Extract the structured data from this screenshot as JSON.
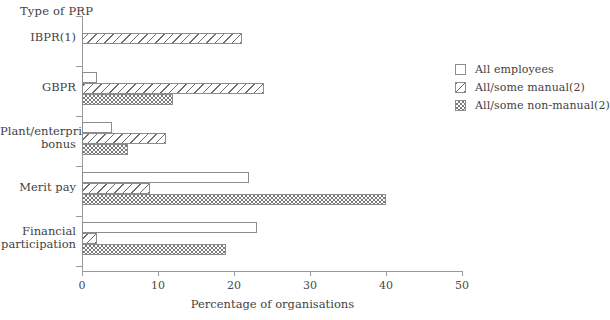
{
  "chart_data": {
    "type": "bar",
    "orientation": "horizontal",
    "title": "",
    "ylabel": "Type of PRP",
    "xlabel": "Percentage of organisations",
    "xlim": [
      0,
      50
    ],
    "xticks": [
      0,
      10,
      20,
      30,
      40,
      50
    ],
    "grid": false,
    "legend_position": "right",
    "categories": [
      "IBPR(1)",
      "GBPR",
      "Plant/enterprise\nbonus",
      "Merit pay",
      "Financial\nparticipation"
    ],
    "series": [
      {
        "name": "All employees",
        "fill": "plain",
        "values": [
          0,
          2,
          4,
          22,
          23
        ]
      },
      {
        "name": "All/some manual(2)",
        "fill": "hatch",
        "values": [
          21,
          24,
          11,
          9,
          2
        ]
      },
      {
        "name": "All/some non-manual(2)",
        "fill": "check",
        "values": [
          0,
          12,
          6,
          40,
          19
        ]
      }
    ]
  },
  "legend": {
    "items": [
      {
        "label": "All employees",
        "fill": "plain"
      },
      {
        "label": "All/some manual(2)",
        "fill": "hatch"
      },
      {
        "label": "All/some non-manual(2)",
        "fill": "check"
      }
    ]
  },
  "colors": {
    "axis": "#9a9a9a",
    "bar_outline": "#8c8c8c",
    "text": "#3f3f3f",
    "hatch": "#6d6d6d",
    "check": "#7a7a7a"
  }
}
